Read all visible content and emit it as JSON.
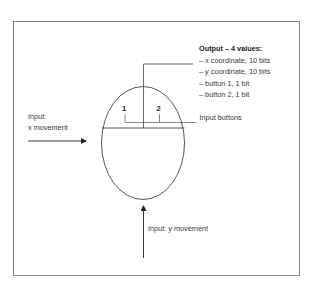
{
  "diagram": {
    "type": "mouse input/output schematic",
    "output": {
      "title": "Output – 4 values:",
      "items": [
        "– x coordinate, 10 bits",
        "– y coordinate, 10 bits",
        "– button 1, 1 bit",
        "– button 2, 1 bit"
      ]
    },
    "buttons": {
      "label": "Input buttons",
      "button_1": "1",
      "button_2": "2"
    },
    "x_input": {
      "line1": "Input:",
      "line2": "x movement"
    },
    "y_input": {
      "label": "Input: y movement"
    },
    "colors": {
      "line": "#333333",
      "frame": "#8a8a8a",
      "background": "#ffffff"
    }
  }
}
